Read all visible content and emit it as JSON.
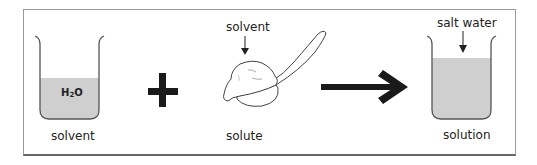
{
  "diagram": {
    "solvent_beaker": {
      "formula_main": "H",
      "formula_sub": "2",
      "formula_end": "O",
      "label": "solvent"
    },
    "operator_plus": "+",
    "solute": {
      "pointer_label": "solvent",
      "label": "solute"
    },
    "solution_beaker": {
      "pointer_label": "salt water",
      "label": "solution"
    },
    "colors": {
      "liquid": "#cfcfcf",
      "outline": "#555555",
      "symbol": "#1a1a1a"
    }
  }
}
